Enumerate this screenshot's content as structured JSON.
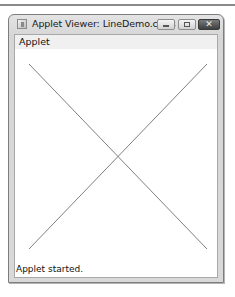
{
  "window": {
    "title": "Applet Viewer: LineDemo.class",
    "icon": "java-applet-icon",
    "controls": {
      "minimize": "minimize-icon",
      "maximize": "maximize-icon",
      "close": "close-icon",
      "close_glyph": "✕"
    }
  },
  "menubar": {
    "items": [
      {
        "label": "Applet"
      }
    ]
  },
  "canvas": {
    "background": "#ffffff",
    "line_color": "#808080",
    "lines": [
      {
        "x1": 28,
        "y1": 63,
        "x2": 206,
        "y2": 248
      },
      {
        "x1": 206,
        "y1": 63,
        "x2": 28,
        "y2": 248
      }
    ]
  },
  "status": {
    "text": "Applet started."
  }
}
